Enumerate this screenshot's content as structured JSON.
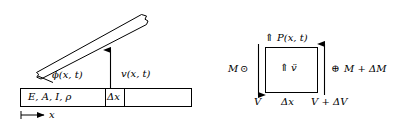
{
  "figure": {
    "background_color": "#ffffff",
    "stroke_color": "#000000",
    "width": 401,
    "height": 127
  },
  "left_diagram": {
    "name": "deflected-beam-and-reference-bar",
    "beam_label": "ϕ(x, t)",
    "deflection_label": "v(x, t)",
    "bar_cells": [
      {
        "label": "E, A, I, ρ"
      },
      {
        "label": "Δx"
      },
      {
        "label": ""
      }
    ],
    "axis_label": "x"
  },
  "right_diagram": {
    "name": "free-body-element",
    "top_label": "P(x, t)",
    "top_arrow_glyph": "⇑",
    "inertia_label": "v̈",
    "inertia_arrow_glyph": "⇑",
    "left_moment_label": "M",
    "left_moment_symbol": "⊙",
    "right_moment_label": "M + ΔM",
    "right_moment_symbol": "⊕",
    "left_shear_label": "V",
    "right_shear_label": "V + ΔV",
    "width_label": "Δx"
  }
}
